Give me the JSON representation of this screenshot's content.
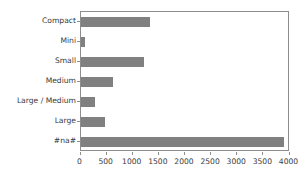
{
  "chart_data": {
    "type": "bar",
    "orientation": "horizontal",
    "title": "",
    "xlabel": "",
    "ylabel": "",
    "categories": [
      "Compact",
      "Mini",
      "Small",
      "Medium",
      "Large / Medium",
      "Large",
      "#na#"
    ],
    "values": [
      1330,
      90,
      1210,
      620,
      275,
      460,
      3890
    ],
    "xlim": [
      0,
      4000
    ],
    "xticks": [
      0,
      500,
      1000,
      1500,
      2000,
      2500,
      3000,
      3500,
      4000
    ],
    "xtick_labels": [
      "0",
      "500",
      "1000",
      "1500",
      "2000",
      "2500",
      "3000",
      "3500",
      "4000"
    ],
    "grid": false,
    "legend": false,
    "bar_color": "#808080",
    "axis_color": "#8d8d8d",
    "tick_label_color": "#3a3a3a",
    "background_color": "#ffffff"
  }
}
